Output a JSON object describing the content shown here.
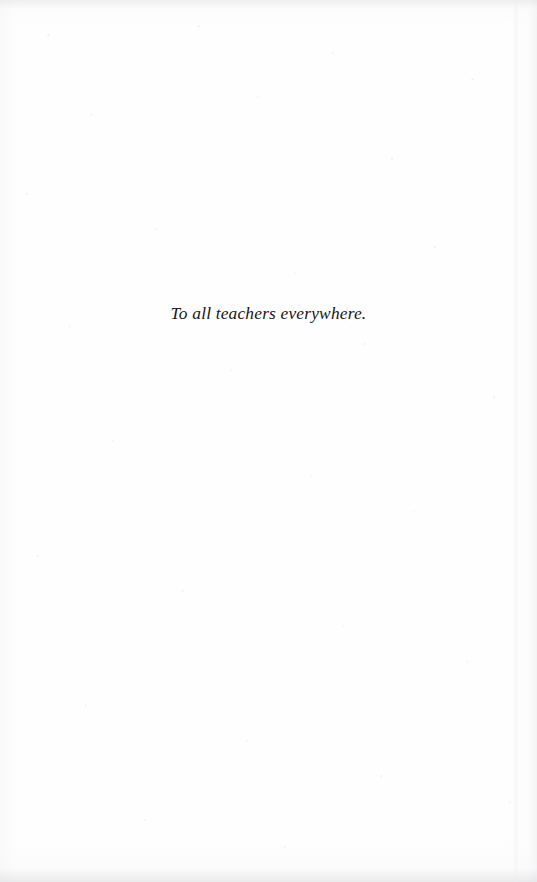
{
  "page": {
    "kind": "book-dedication-page",
    "background_color": "#fefefe",
    "width": 537,
    "height": 882
  },
  "dedication": {
    "text": "To all teachers everywhere.",
    "color": "#1a1614",
    "style": "italic-serif",
    "alignment": "center"
  },
  "artifacts": {
    "scan_mark_label": "",
    "edge_band_label": "",
    "speckle_label": ""
  }
}
